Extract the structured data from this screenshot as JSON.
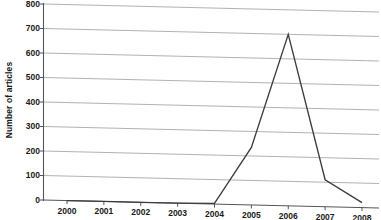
{
  "chart_data": {
    "type": "line",
    "title": "",
    "subtitle": "",
    "xlabel": "",
    "ylabel": "Number of articles",
    "categories": [
      "2000",
      "2001",
      "2002",
      "2003",
      "2004",
      "2005",
      "2006",
      "2007",
      "2008"
    ],
    "values": [
      0,
      0,
      0,
      0,
      3,
      235,
      700,
      110,
      20
    ],
    "series": [
      {
        "name": "Number of articles",
        "values": [
          0,
          0,
          0,
          0,
          3,
          235,
          700,
          110,
          20
        ]
      }
    ],
    "ylim": [
      0,
      800
    ],
    "ytick_labels": [
      "0",
      "100",
      "200",
      "300",
      "400",
      "500",
      "600",
      "700",
      "800"
    ],
    "ytick_values": [
      0,
      100,
      200,
      300,
      400,
      500,
      600,
      700,
      800
    ],
    "xtick_labels": [
      "2000",
      "2001",
      "2002",
      "2003",
      "2004",
      "2005",
      "2006",
      "2007",
      "2008"
    ],
    "grid": "horizontal",
    "legend": "none",
    "annotations": [],
    "colors": {
      "line": "#3c3c3c",
      "gridline": "#a9a9a9",
      "axis": "#555555",
      "text": "#1a1a1a",
      "background": "#ffffff"
    }
  }
}
